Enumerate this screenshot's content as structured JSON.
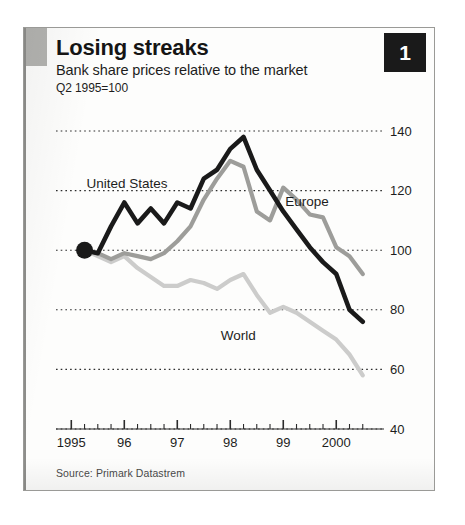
{
  "card": {
    "badge_number": "1",
    "title": "Losing streaks",
    "subtitle": "Bank share prices relative to the market",
    "basis": "Q2 1995=100",
    "source": "Source: Primark Datastrem"
  },
  "colors": {
    "united_states": "#1a1a1a",
    "europe": "#9d9d9a",
    "world": "#cccccb",
    "gridline": "#2b2b2b",
    "badge_background": "#1a1a1a",
    "badge_text": "#ffffff",
    "accent_block": "#b3b3b0",
    "card_border": "#9a9a97",
    "paper": "#fdfdfc"
  },
  "chart_data": {
    "type": "line",
    "title": "Losing streaks",
    "subtitle": "Bank share prices relative to the market",
    "note": "Q2 1995=100",
    "xlabel": "",
    "ylabel": "",
    "ylim": [
      40,
      150
    ],
    "yticks": [
      40,
      60,
      80,
      100,
      120,
      140
    ],
    "ytick_labels": [
      "40",
      "60",
      "80",
      "100",
      "120",
      "140"
    ],
    "y_axis_side": "right",
    "grid": true,
    "grid_style": "dotted-horizontal",
    "legend": "inline-labels",
    "xlim": [
      1994.9,
      2000.75
    ],
    "xticks_major": [
      1995,
      1996,
      1997,
      1998,
      1999,
      2000
    ],
    "xtick_labels": [
      "1995",
      "96",
      "97",
      "98",
      "99",
      "2000"
    ],
    "xticks_minor_interval": 0.25,
    "x_unit": "quarter",
    "origin_marker": {
      "x": 1995.25,
      "y": 100,
      "label": "Q2 1995=100"
    },
    "series": [
      {
        "name": "United States",
        "color": "#1a1a1a",
        "label_position": {
          "x": 1996.05,
          "y": 121
        },
        "x": [
          1995.25,
          1995.5,
          1995.75,
          1996.0,
          1996.25,
          1996.5,
          1996.75,
          1997.0,
          1997.25,
          1997.5,
          1997.75,
          1998.0,
          1998.25,
          1998.5,
          1998.75,
          1999.0,
          1999.25,
          1999.5,
          1999.75,
          2000.0,
          2000.25,
          2000.5
        ],
        "values": [
          100,
          99,
          108,
          116,
          109,
          114,
          109,
          116,
          114,
          124,
          127,
          134,
          138,
          127,
          120,
          113,
          107,
          101,
          96,
          92,
          80,
          76
        ]
      },
      {
        "name": "Europe",
        "color": "#9d9d9a",
        "label_position": {
          "x": 1999.45,
          "y": 115
        },
        "x": [
          1995.25,
          1995.5,
          1995.75,
          1996.0,
          1996.25,
          1996.5,
          1996.75,
          1997.0,
          1997.25,
          1997.5,
          1997.75,
          1998.0,
          1998.25,
          1998.5,
          1998.75,
          1999.0,
          1999.25,
          1999.5,
          1999.75,
          2000.0,
          2000.25,
          2000.5
        ],
        "values": [
          100,
          99,
          97,
          99,
          98,
          97,
          99,
          103,
          108,
          117,
          124,
          130,
          128,
          113,
          110,
          121,
          117,
          112,
          111,
          101,
          98,
          92
        ]
      },
      {
        "name": "World",
        "color": "#cccccb",
        "label_position": {
          "x": 1998.15,
          "y": 70
        },
        "x": [
          1995.25,
          1995.5,
          1995.75,
          1996.0,
          1996.25,
          1996.5,
          1996.75,
          1997.0,
          1997.25,
          1997.5,
          1997.75,
          1998.0,
          1998.25,
          1998.5,
          1998.75,
          1999.0,
          1999.25,
          1999.5,
          1999.75,
          2000.0,
          2000.25,
          2000.5
        ],
        "values": [
          100,
          98,
          96,
          98,
          94,
          91,
          88,
          88,
          90,
          89,
          87,
          90,
          92,
          85,
          79,
          81,
          79,
          76,
          73,
          70,
          65,
          58
        ]
      }
    ]
  }
}
